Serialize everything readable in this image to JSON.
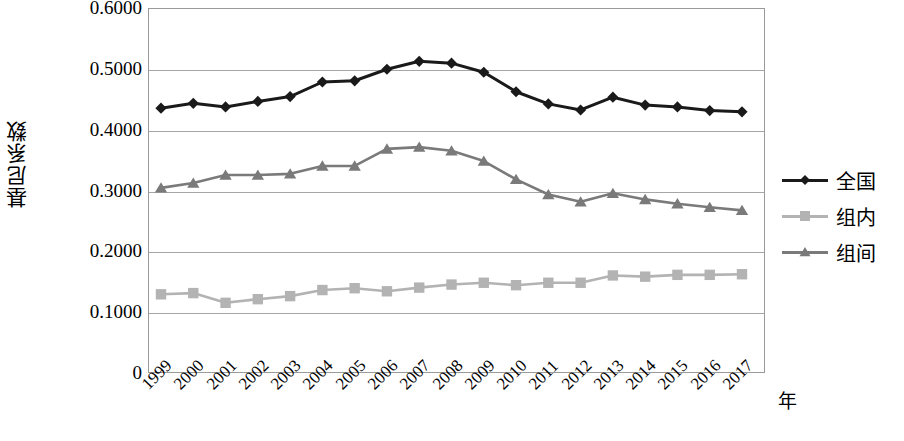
{
  "chart_data": {
    "type": "line",
    "title": "",
    "xlabel": "年",
    "ylabel": "基尼系数",
    "x": [
      1999,
      2000,
      2001,
      2002,
      2003,
      2004,
      2005,
      2006,
      2007,
      2008,
      2009,
      2010,
      2011,
      2012,
      2013,
      2014,
      2015,
      2016,
      2017
    ],
    "categories": [
      "1999",
      "2000",
      "2001",
      "2002",
      "2003",
      "2004",
      "2005",
      "2006",
      "2007",
      "2008",
      "2009",
      "2010",
      "2011",
      "2012",
      "2013",
      "2014",
      "2015",
      "2016",
      "2017"
    ],
    "ylim": [
      0,
      0.6
    ],
    "yticks": [
      0,
      0.1,
      0.2,
      0.3,
      0.4,
      0.5,
      0.6
    ],
    "ytick_labels": [
      "0",
      "0.1000",
      "0.2000",
      "0.3000",
      "0.4000",
      "0.5000",
      "0.6000"
    ],
    "grid": true,
    "legend_position": "right",
    "series": [
      {
        "name": "全国",
        "marker": "diamond",
        "color": "#1a1a1a",
        "values": [
          0.437,
          0.445,
          0.439,
          0.448,
          0.456,
          0.48,
          0.482,
          0.501,
          0.514,
          0.511,
          0.496,
          0.464,
          0.444,
          0.434,
          0.455,
          0.442,
          0.439,
          0.433,
          0.431
        ]
      },
      {
        "name": "组内",
        "marker": "square",
        "color": "#b3b3b3",
        "values": [
          0.131,
          0.133,
          0.117,
          0.123,
          0.128,
          0.138,
          0.141,
          0.136,
          0.142,
          0.147,
          0.15,
          0.146,
          0.15,
          0.15,
          0.162,
          0.16,
          0.163,
          0.163,
          0.164
        ]
      },
      {
        "name": "组间",
        "marker": "triangle",
        "color": "#7a7a7a",
        "values": [
          0.306,
          0.314,
          0.327,
          0.327,
          0.329,
          0.342,
          0.342,
          0.37,
          0.373,
          0.367,
          0.35,
          0.32,
          0.295,
          0.283,
          0.297,
          0.287,
          0.28,
          0.274,
          0.269
        ]
      }
    ]
  },
  "axis": {
    "y_title": "基尼系数",
    "x_unit": "年"
  },
  "legend": {
    "items": [
      {
        "label": "全国"
      },
      {
        "label": "组内"
      },
      {
        "label": "组间"
      }
    ]
  },
  "colors": {
    "series_national": "#1a1a1a",
    "series_within": "#b3b3b3",
    "series_between": "#7a7a7a",
    "gridline": "#a6a6a6",
    "border": "#9a9a9a",
    "background": "#ffffff"
  }
}
